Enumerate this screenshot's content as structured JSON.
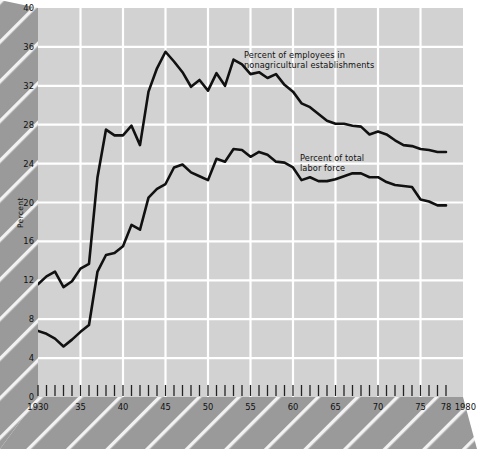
{
  "figure": {
    "background_color": "#ffffff",
    "plot_background_color": "#d2d2d2",
    "band_color": "#9a9a9a",
    "gridline_color": "#ffffff",
    "line_color": "#111111",
    "axis_label_y": "Percent",
    "y_ticks": [
      "0",
      "4",
      "8",
      "12",
      "16",
      "20",
      "24",
      "28",
      "32",
      "36",
      "40"
    ],
    "x_ticks": [
      "1930",
      "35",
      "40",
      "45",
      "50",
      "55",
      "60",
      "65",
      "70",
      "75",
      "78",
      "1980"
    ],
    "annotations": [
      {
        "name": "series-label-nonagricultural",
        "line1": "Percent of employees in",
        "line2": "nonagricultural establishments"
      },
      {
        "name": "series-label-labor-force",
        "line1": "Percent of total",
        "line2": "labor force"
      }
    ]
  },
  "chart_data": {
    "type": "line",
    "title": "",
    "xlabel": "",
    "ylabel": "Percent",
    "xlim": [
      1930,
      1980
    ],
    "ylim": [
      0,
      40
    ],
    "grid": true,
    "legend": "inline-annotations",
    "x": [
      1930,
      1931,
      1932,
      1933,
      1934,
      1935,
      1936,
      1937,
      1938,
      1939,
      1940,
      1941,
      1942,
      1943,
      1944,
      1945,
      1946,
      1947,
      1948,
      1949,
      1950,
      1951,
      1952,
      1953,
      1954,
      1955,
      1956,
      1957,
      1958,
      1959,
      1960,
      1961,
      1962,
      1963,
      1964,
      1965,
      1966,
      1967,
      1968,
      1969,
      1970,
      1971,
      1972,
      1973,
      1974,
      1975,
      1976,
      1977,
      1978
    ],
    "series": [
      {
        "name": "Percent of employees in nonagricultural establishments",
        "values": [
          11.6,
          12.4,
          12.9,
          11.3,
          11.9,
          13.2,
          13.7,
          22.6,
          27.5,
          26.9,
          26.9,
          27.9,
          25.9,
          31.4,
          33.8,
          35.5,
          34.5,
          33.4,
          31.9,
          32.6,
          31.5,
          33.3,
          32.0,
          34.7,
          34.2,
          33.2,
          33.4,
          32.8,
          33.2,
          32.1,
          31.4,
          30.2,
          29.8,
          29.1,
          28.4,
          28.1,
          28.1,
          27.9,
          27.8,
          27.0,
          27.3,
          27.0,
          26.4,
          25.9,
          25.8,
          25.5,
          25.4,
          25.2,
          25.2
        ]
      },
      {
        "name": "Percent of total labor force",
        "values": [
          6.8,
          6.5,
          6.0,
          5.2,
          5.9,
          6.7,
          7.4,
          12.9,
          14.6,
          14.8,
          15.5,
          17.7,
          17.2,
          20.5,
          21.4,
          21.9,
          23.6,
          23.9,
          23.1,
          22.7,
          22.3,
          24.5,
          24.2,
          25.5,
          25.4,
          24.7,
          25.2,
          24.9,
          24.2,
          24.1,
          23.6,
          22.3,
          22.6,
          22.2,
          22.2,
          22.4,
          22.7,
          23.0,
          23.0,
          22.6,
          22.6,
          22.1,
          21.8,
          21.7,
          21.6,
          20.3,
          20.1,
          19.7,
          19.7
        ]
      }
    ]
  }
}
